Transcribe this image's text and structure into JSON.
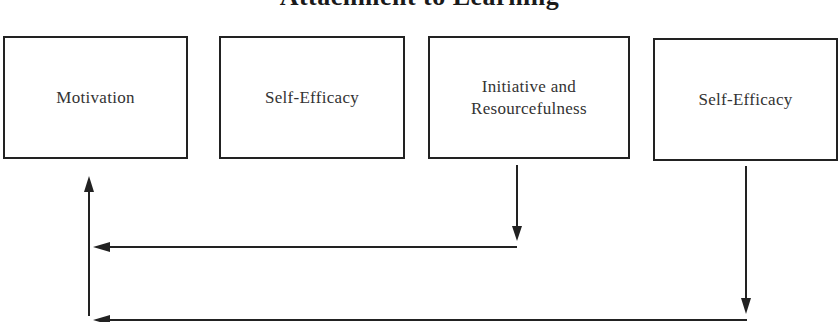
{
  "diagram": {
    "title": "Attachment to Learning",
    "boxes": [
      {
        "id": "motivation",
        "label": "Motivation"
      },
      {
        "id": "self-efficacy-1",
        "label": "Self-Efficacy"
      },
      {
        "id": "initiative",
        "label": "Initiative and\nResourcefulness"
      },
      {
        "id": "self-efficacy-2",
        "label": "Self-Efficacy"
      }
    ],
    "connections": [
      {
        "from": "initiative",
        "to": "motivation",
        "type": "feedback-arrow"
      },
      {
        "from": "self-efficacy-2",
        "to": "motivation",
        "type": "feedback-arrow"
      }
    ],
    "colors": {
      "stroke": "#222222",
      "text": "#333333",
      "background": "#ffffff"
    }
  }
}
